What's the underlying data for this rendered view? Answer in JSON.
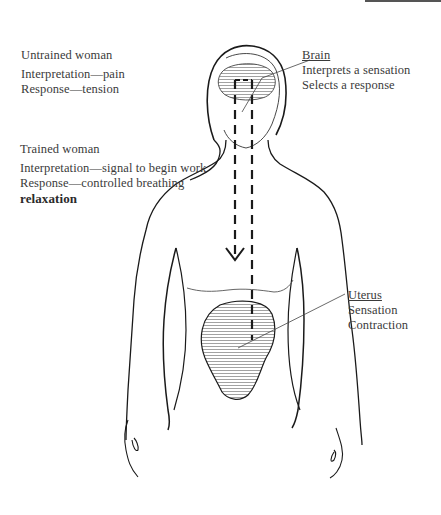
{
  "figure": {
    "untrained": {
      "title": "Untrained woman",
      "interpretation": "Interpretation—pain",
      "response": "Response—tension"
    },
    "trained": {
      "title": "Trained woman",
      "interpretation": "Interpretation—signal to begin work",
      "response": "Response—controlled breathing",
      "extra": "relaxation"
    },
    "brain": {
      "title": "Brain",
      "line1": "Interprets a sensation",
      "line2": "Selects a response"
    },
    "uterus": {
      "title": "Uterus",
      "line1": "Sensation",
      "line2": "Contraction"
    },
    "colors": {
      "ink": "#1a1a1a",
      "text": "#3a3a3a",
      "hatch": "#8a8a8a"
    }
  }
}
